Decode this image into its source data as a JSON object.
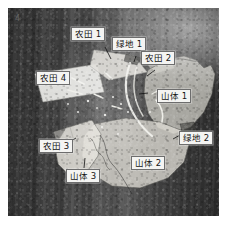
{
  "figure": {
    "kind": "annotated-remote-sensing-image",
    "colorization": "grayscale",
    "frame_color": "#ffffff",
    "corner_mark": "4"
  },
  "annotations": [
    {
      "id": "nongtian-1",
      "label": "农田 1",
      "category": "farmland",
      "index": 1,
      "x": 71,
      "y": 27,
      "leader": {
        "length": 13,
        "angle": 70
      }
    },
    {
      "id": "lvdi-1",
      "label": "绿地 1",
      "category": "green-space",
      "index": 1,
      "x": 112,
      "y": 37,
      "leader": {
        "length": 10,
        "angle": 78
      }
    },
    {
      "id": "nongtian-2",
      "label": "农田 2",
      "category": "farmland",
      "index": 2,
      "x": 141,
      "y": 51,
      "leader": {
        "length": 12,
        "angle": 140
      }
    },
    {
      "id": "nongtian-4",
      "label": "农田 4",
      "category": "farmland",
      "index": 4,
      "x": 36,
      "y": 71,
      "leader": {
        "length": 0,
        "angle": 0
      }
    },
    {
      "id": "shanti-1",
      "label": "山体 1",
      "category": "mountain",
      "index": 1,
      "x": 157,
      "y": 89,
      "leader": {
        "length": 11,
        "angle": 185
      }
    },
    {
      "id": "lvdi-2",
      "label": "绿地 2",
      "category": "green-space",
      "index": 2,
      "x": 179,
      "y": 131,
      "leader": {
        "length": 12,
        "angle": 205
      }
    },
    {
      "id": "nongtian-3",
      "label": "农田 3",
      "category": "farmland",
      "index": 3,
      "x": 39,
      "y": 139,
      "leader": {
        "length": 13,
        "angle": 20
      }
    },
    {
      "id": "shanti-2",
      "label": "山体 2",
      "category": "mountain",
      "index": 2,
      "x": 131,
      "y": 156,
      "leader": {
        "length": 0,
        "angle": 0
      }
    },
    {
      "id": "shanti-3",
      "label": "山体 3",
      "category": "mountain",
      "index": 3,
      "x": 66,
      "y": 169,
      "leader": {
        "length": 14,
        "angle": 290
      }
    }
  ],
  "legend_semantics": {
    "farmland": "农田",
    "green_space": "绿地",
    "mountain": "山体"
  }
}
